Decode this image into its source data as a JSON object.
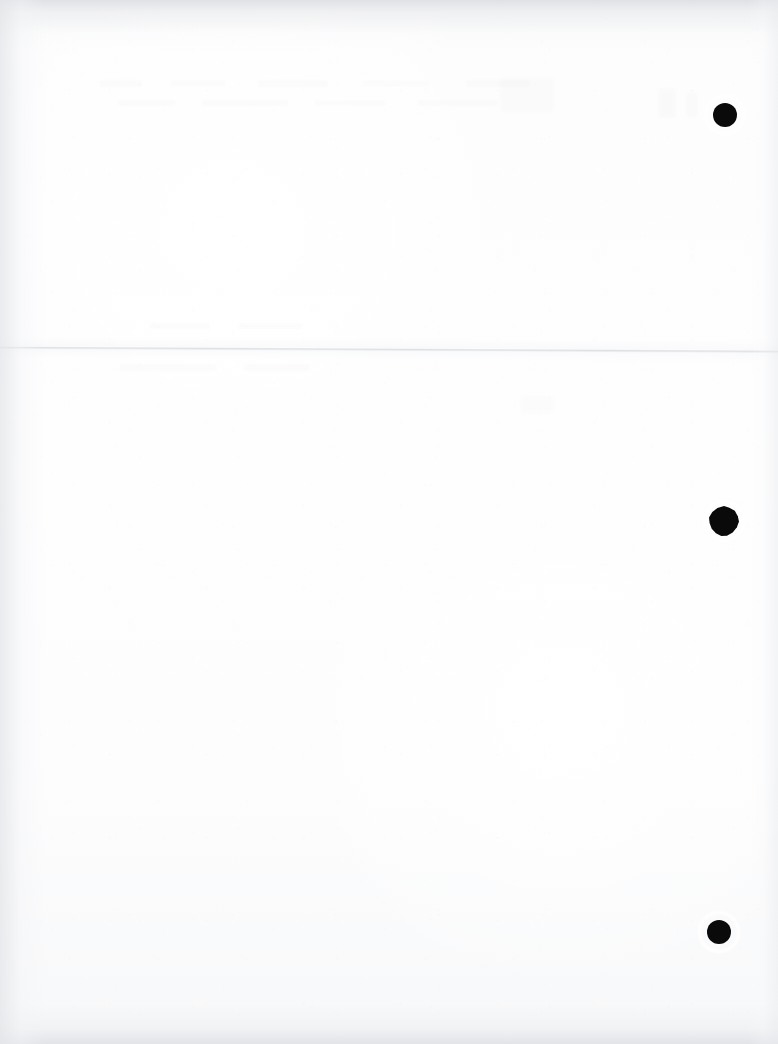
{
  "document": {
    "kind": "scanned-page",
    "description": "Blank three-hole-punched sheet, scanned",
    "width_px": 778,
    "height_px": 1044,
    "page_text": "",
    "legible_text_present": false
  },
  "appearance": {
    "paper_color": "#fcfcfd",
    "interior_white": "#ffffff",
    "edge_shadow_color": "#ecedef",
    "edge_shadow_dark": "#dee0e4",
    "hole_color": "#0a0a0a",
    "crease_color": "#cdd0d5"
  },
  "punch_holes": [
    {
      "id": "hole-top",
      "cx": 725,
      "cy": 115,
      "r": 12,
      "torn": false
    },
    {
      "id": "hole-middle",
      "cx": 724,
      "cy": 521,
      "r": 13,
      "torn": true
    },
    {
      "id": "hole-bottom",
      "cx": 719,
      "cy": 932,
      "r": 12,
      "torn": false
    }
  ],
  "fold": {
    "id": "horizontal-crease",
    "y_left_px": 346,
    "y_right_px": 350,
    "spans_full_width": true
  },
  "ghosting": {
    "note": "Faint bleed-through smudges in upper third; no recoverable characters.",
    "regions": [
      {
        "id": "ghost-upper-line-1",
        "x": 100,
        "y": 74,
        "w": 500,
        "h": 58
      },
      {
        "id": "ghost-upper-line-2",
        "x": 118,
        "y": 96,
        "w": 460,
        "h": 40
      },
      {
        "id": "ghost-mid-line-1",
        "x": 150,
        "y": 318,
        "w": 220,
        "h": 26
      },
      {
        "id": "ghost-mid-line-2",
        "x": 120,
        "y": 360,
        "w": 250,
        "h": 34
      },
      {
        "id": "ghost-blob-a",
        "x": 500,
        "y": 78,
        "w": 54,
        "h": 34
      },
      {
        "id": "ghost-blob-b",
        "x": 658,
        "y": 88,
        "w": 18,
        "h": 30
      },
      {
        "id": "ghost-blob-c",
        "x": 686,
        "y": 92,
        "w": 12,
        "h": 26
      },
      {
        "id": "ghost-blob-d",
        "x": 520,
        "y": 396,
        "w": 34,
        "h": 18
      }
    ]
  }
}
